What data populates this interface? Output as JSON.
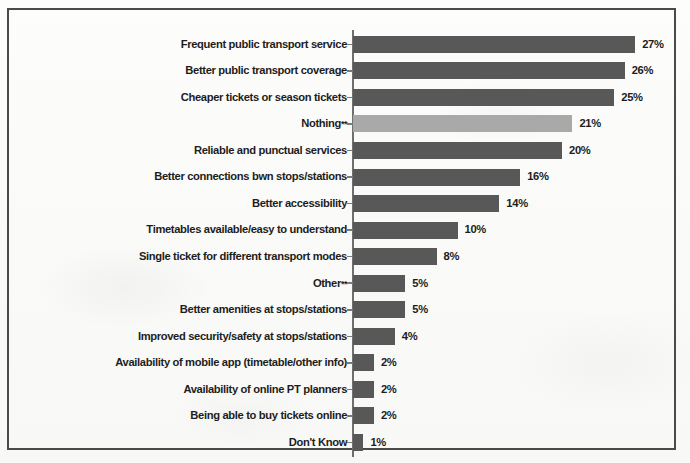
{
  "figure": {
    "kind": "scanned-horizontal-bar-chart",
    "border_color": "#4a4a4a",
    "background_color": "#fbfbfa"
  },
  "style": {
    "bar_color": "#585858",
    "bar_highlight_color": "#a9a9a9",
    "text_color": "#1d1d1d",
    "axis_color": "#6f6f6f"
  },
  "chart_data": {
    "type": "bar",
    "orientation": "horizontal",
    "title": "",
    "subtitle": "",
    "xlabel": "",
    "ylabel": "",
    "grid": false,
    "legend": "none",
    "xlim": [
      0,
      30
    ],
    "value_suffix": "%",
    "categories": [
      "Frequent public transport service",
      "Better public transport coverage",
      "Cheaper tickets or season tickets",
      "Nothing**",
      "Reliable and punctual services",
      "Better connections bwn stops/stations",
      "Better accessibility",
      "Timetables available/easy to understand",
      "Single ticket for different transport modes",
      "Other**",
      "Better amenities at stops/stations",
      "Improved security/safety at stops/stations",
      "Availability of mobile app (timetable/other info)",
      "Availability of online PT planners",
      "Being able to buy tickets online",
      "Don't Know"
    ],
    "values": [
      27,
      26,
      25,
      21,
      20,
      16,
      14,
      10,
      8,
      5,
      5,
      4,
      2,
      2,
      2,
      1
    ],
    "value_labels": [
      "27%",
      "26%",
      "25%",
      "21%",
      "20%",
      "16%",
      "14%",
      "10%",
      "8%",
      "5%",
      "5%",
      "4%",
      "2%",
      "2%",
      "2%",
      "1%"
    ],
    "highlighted_indices": [
      3
    ],
    "annotations": [
      "**"
    ]
  }
}
